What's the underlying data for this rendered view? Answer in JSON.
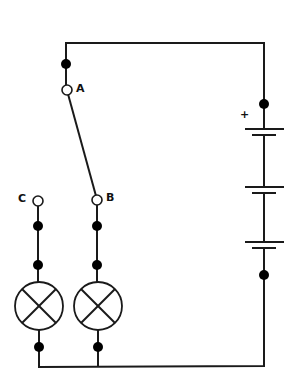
{
  "diagram": {
    "type": "electrical circuit",
    "terminals": [
      {
        "id": "A",
        "label": "A"
      },
      {
        "id": "B",
        "label": "B"
      },
      {
        "id": "C",
        "label": "C"
      }
    ],
    "battery": {
      "polarity_label": "+",
      "cells": 3
    },
    "lamps": 2,
    "switch": "A to B"
  }
}
